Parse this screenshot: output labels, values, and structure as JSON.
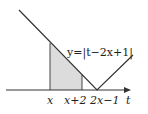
{
  "diagram": {
    "equation": "y=|t−2x+1|",
    "axis_label": "t",
    "tick_labels": [
      "x",
      "x+2",
      "2x−1"
    ],
    "shaded_fill": "#dcdcdc",
    "line_color": "#333333"
  }
}
